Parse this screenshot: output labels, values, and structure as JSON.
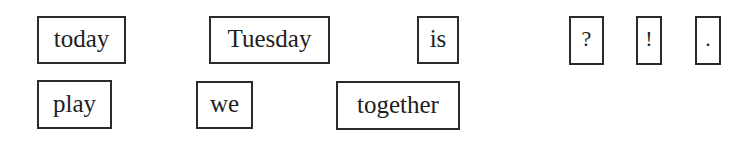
{
  "word_cards": {
    "row1": [
      {
        "label": "today"
      },
      {
        "label": "Tuesday"
      },
      {
        "label": "is"
      },
      {
        "label": "?"
      },
      {
        "label": "!"
      },
      {
        "label": "."
      }
    ],
    "row2": [
      {
        "label": "play"
      },
      {
        "label": "we"
      },
      {
        "label": "together"
      }
    ]
  }
}
